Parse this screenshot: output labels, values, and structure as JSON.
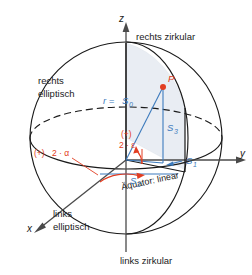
{
  "figure": {
    "background": "#ffffff"
  },
  "colors": {
    "stroke": "#1a1a1a",
    "blue": "#3d7bbd",
    "red": "#e23d21",
    "fill_sector": "#e8ecf2"
  },
  "axes": {
    "x": "x",
    "y": "y",
    "z": "z"
  },
  "labels": {
    "top_pole": "rechts zirkular",
    "bottom_pole": "links zirkular",
    "upper_left_1": "rechts",
    "upper_left_2": "elliptisch",
    "lower_left_1": "links",
    "lower_left_2": "elliptisch",
    "equator": "Äquator: linear",
    "point": "P"
  },
  "stokes": {
    "s0": "S",
    "s0_sub": "0",
    "s0_prefix": "r =",
    "s1": "S",
    "s1_sub": "1",
    "s2": "S",
    "s2_sub": "2",
    "s3": "S",
    "s3_sub": "3"
  },
  "angles": {
    "alpha_sign": "(+)",
    "alpha": "2 · α",
    "epsilon_sign": "(+)",
    "epsilon": "2 · ε"
  }
}
